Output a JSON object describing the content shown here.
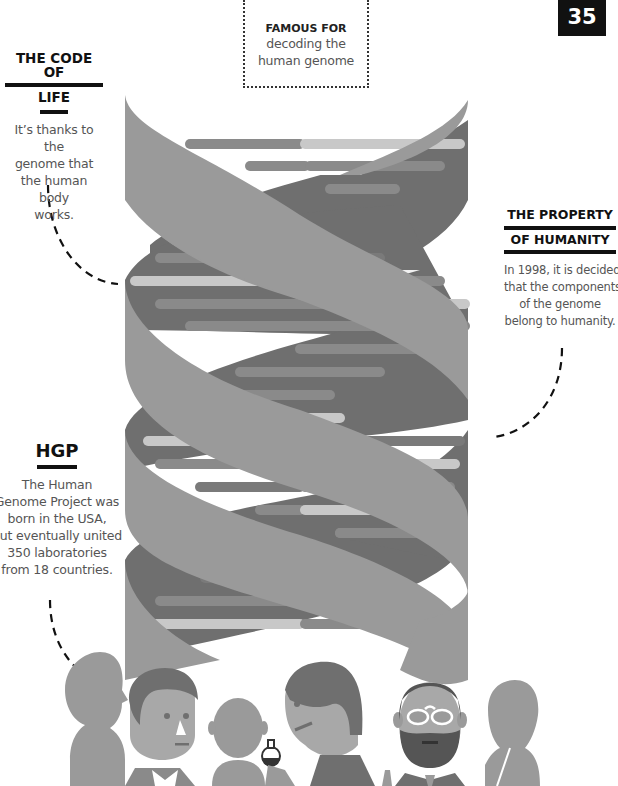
{
  "page_number": "35",
  "famous_for": {
    "label": "FAMOUS FOR",
    "line1": "decoding the",
    "line2": "human genome"
  },
  "code_of_life": {
    "title_line1": "THE CODE OF",
    "title_line2": "LIFE",
    "text_lines": [
      "It’s thanks to the",
      "genome that",
      "the human body",
      "works."
    ]
  },
  "property": {
    "title_line1": "THE PROPERTY",
    "title_line2": "OF HUMANITY",
    "text_lines": [
      "In 1998, it is decided",
      "that the components",
      "of the genome",
      "belong to humanity."
    ]
  },
  "hgp": {
    "title": "HGP",
    "text_lines": [
      "The Human",
      "Genome Project was",
      "born in the USA,",
      "but eventually united",
      "350 laboratories",
      "from 18 countries."
    ]
  },
  "colors": {
    "strand_light": "#9a9a9a",
    "strand_dark": "#6f6f6f",
    "rung_light": "#c8c8c8",
    "rung_mid": "#8a8a8a",
    "ink": "#111111"
  },
  "illustration": {
    "subject": "dna-double-helix",
    "figures": [
      "woman-silhouette",
      "man-with-glasses",
      "bald-child",
      "scientist-with-flask",
      "bearded-man-with-glasses",
      "woman-silhouette-pencil"
    ]
  }
}
